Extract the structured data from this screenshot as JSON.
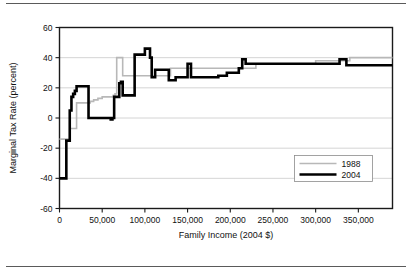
{
  "figure": {
    "top_rule": "",
    "bottom_rule": ""
  },
  "chart_data": {
    "type": "line",
    "title": "",
    "subtitle": "",
    "xlabel": "Family Income (2004 $)",
    "ylabel": "Marginal Tax Rate (percent)",
    "xlim": [
      0,
      390000
    ],
    "ylim": [
      -60,
      60
    ],
    "grid": true,
    "grid_axis": "y",
    "legend_position": "inside-lower-right",
    "xticks": [
      0,
      50000,
      100000,
      150000,
      200000,
      250000,
      300000,
      350000
    ],
    "xticklabels": [
      "0",
      "50,000",
      "100,000",
      "150,000",
      "200,000",
      "250,000",
      "300,000",
      "350,000"
    ],
    "yticks": [
      -60,
      -40,
      -20,
      0,
      20,
      40,
      60
    ],
    "yticklabels": [
      "-60",
      "-40",
      "-20",
      "0",
      "20",
      "40",
      "60"
    ],
    "colors": {
      "series_1988": "#b8b8b8",
      "series_2004": "#000000",
      "axis": "#1a1a1a",
      "grid": "#c9c9c9"
    },
    "series": [
      {
        "name": "1988",
        "color": "#b8b8b8",
        "width": 1.6,
        "step": "post",
        "x": [
          0,
          3000,
          6000,
          9000,
          12000,
          16000,
          20000,
          24000,
          28000,
          32000,
          36000,
          40000,
          45000,
          50000,
          55000,
          60000,
          63000,
          65000,
          67000,
          70000,
          74000,
          80000,
          90000,
          100000,
          110000,
          120000,
          130000,
          150000,
          170000,
          200000,
          230000,
          260000,
          300000,
          340000,
          370000,
          390000
        ],
        "y": [
          -14,
          -14,
          -14,
          -14,
          -7,
          -7,
          10,
          10,
          10,
          10,
          11,
          12,
          13,
          14,
          14,
          14,
          15,
          16,
          40,
          40,
          28,
          28,
          28,
          28,
          28,
          28,
          33,
          33,
          33,
          33,
          36,
          36,
          38,
          40,
          40,
          40
        ]
      },
      {
        "name": "2004",
        "color": "#000000",
        "width": 2.6,
        "step": "post",
        "x": [
          0,
          4000,
          6000,
          8000,
          10000,
          12000,
          14000,
          16000,
          18000,
          20000,
          24000,
          28000,
          30000,
          34000,
          40000,
          46000,
          52000,
          58000,
          60000,
          62000,
          64000,
          66000,
          68000,
          70000,
          72000,
          74000,
          78000,
          82000,
          86000,
          88000,
          92000,
          96000,
          100000,
          102000,
          104000,
          106000,
          108000,
          112000,
          116000,
          120000,
          124000,
          128000,
          132000,
          136000,
          142000,
          148000,
          150000,
          152000,
          154000,
          156000,
          160000,
          170000,
          180000,
          186000,
          192000,
          196000,
          200000,
          206000,
          210000,
          214000,
          216000,
          218000,
          222000,
          240000,
          280000,
          320000,
          328000,
          332000,
          336000,
          360000,
          390000
        ],
        "y": [
          -40,
          -40,
          -40,
          -15,
          -15,
          5,
          14,
          16,
          18,
          21,
          21,
          21,
          21,
          0,
          0,
          0,
          0,
          0,
          -1,
          0,
          14,
          14,
          14,
          23,
          24,
          15,
          15,
          15,
          15,
          42,
          42,
          42,
          46,
          46,
          46,
          40,
          27,
          32,
          32,
          32,
          32,
          25,
          25,
          27,
          27,
          27,
          36,
          36,
          27,
          27,
          27,
          27,
          27,
          28,
          28,
          30,
          30,
          30,
          33,
          39,
          39,
          36,
          36,
          36,
          36,
          36,
          39,
          39,
          35,
          35,
          35
        ]
      }
    ]
  },
  "legend": {
    "items": [
      {
        "label": "1988",
        "color": "#b8b8b8"
      },
      {
        "label": "2004",
        "color": "#000000"
      }
    ]
  }
}
